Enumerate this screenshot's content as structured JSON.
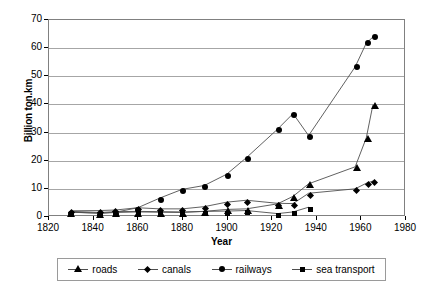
{
  "chart_data": {
    "type": "line",
    "title": "",
    "xlabel": "Year",
    "ylabel": "Billion ton.km",
    "xlim": [
      1820,
      1980
    ],
    "ylim": [
      0,
      70
    ],
    "xticks": [
      1820,
      1840,
      1860,
      1880,
      1900,
      1920,
      1940,
      1960,
      1980
    ],
    "yticks": [
      0,
      10,
      20,
      30,
      40,
      50,
      60,
      70
    ],
    "grid": "horizontal",
    "legend_position": "bottom",
    "series": [
      {
        "name": "roads",
        "marker": "triangle",
        "points": [
          {
            "x": 1830,
            "y": 1.0
          },
          {
            "x": 1843,
            "y": 0.6
          },
          {
            "x": 1850,
            "y": 0.9
          },
          {
            "x": 1860,
            "y": 1.1
          },
          {
            "x": 1870,
            "y": 1.0
          },
          {
            "x": 1880,
            "y": 0.9
          },
          {
            "x": 1890,
            "y": 1.3
          },
          {
            "x": 1900,
            "y": 2.0
          },
          {
            "x": 1909,
            "y": 2.2
          },
          {
            "x": 1923,
            "y": 4.0
          },
          {
            "x": 1930,
            "y": 6.7
          },
          {
            "x": 1937,
            "y": 11.2
          },
          {
            "x": 1958,
            "y": 17.3
          },
          {
            "x": 1963,
            "y": 27.7
          },
          {
            "x": 1966,
            "y": 39.6
          }
        ]
      },
      {
        "name": "canals",
        "marker": "diamond",
        "points": [
          {
            "x": 1830,
            "y": 1.5
          },
          {
            "x": 1843,
            "y": 1.6
          },
          {
            "x": 1850,
            "y": 1.8
          },
          {
            "x": 1860,
            "y": 2.6
          },
          {
            "x": 1870,
            "y": 2.2
          },
          {
            "x": 1880,
            "y": 2.2
          },
          {
            "x": 1890,
            "y": 3.0
          },
          {
            "x": 1900,
            "y": 4.6
          },
          {
            "x": 1909,
            "y": 5.3
          },
          {
            "x": 1923,
            "y": 4.2
          },
          {
            "x": 1930,
            "y": 4.1
          },
          {
            "x": 1937,
            "y": 7.8
          },
          {
            "x": 1958,
            "y": 9.4
          },
          {
            "x": 1963,
            "y": 11.4
          },
          {
            "x": 1966,
            "y": 12.2
          }
        ]
      },
      {
        "name": "railways",
        "marker": "circle",
        "points": [
          {
            "x": 1830,
            "y": 1.0
          },
          {
            "x": 1843,
            "y": 0.7
          },
          {
            "x": 1850,
            "y": 1.0
          },
          {
            "x": 1860,
            "y": 2.6
          },
          {
            "x": 1870,
            "y": 6.1
          },
          {
            "x": 1880,
            "y": 9.2
          },
          {
            "x": 1890,
            "y": 10.6
          },
          {
            "x": 1900,
            "y": 14.6
          },
          {
            "x": 1909,
            "y": 20.6
          },
          {
            "x": 1923,
            "y": 30.8
          },
          {
            "x": 1930,
            "y": 36.4
          },
          {
            "x": 1937,
            "y": 28.5
          },
          {
            "x": 1958,
            "y": 53.2
          },
          {
            "x": 1963,
            "y": 61.7
          },
          {
            "x": 1966,
            "y": 63.9
          }
        ]
      },
      {
        "name": "sea transport",
        "marker": "square",
        "points": [
          {
            "x": 1830,
            "y": 1.3
          },
          {
            "x": 1843,
            "y": 0.9
          },
          {
            "x": 1850,
            "y": 1.2
          },
          {
            "x": 1860,
            "y": 1.3
          },
          {
            "x": 1870,
            "y": 1.2
          },
          {
            "x": 1880,
            "y": 1.1
          },
          {
            "x": 1890,
            "y": 1.3
          },
          {
            "x": 1900,
            "y": 1.4
          },
          {
            "x": 1909,
            "y": 1.6
          },
          {
            "x": 1923,
            "y": 0.5
          },
          {
            "x": 1930,
            "y": 1.1
          },
          {
            "x": 1937,
            "y": 2.8
          }
        ]
      }
    ]
  },
  "legend": {
    "items": [
      {
        "label": "roads",
        "marker": "triangle"
      },
      {
        "label": "canals",
        "marker": "diamond"
      },
      {
        "label": "railways",
        "marker": "circle"
      },
      {
        "label": "sea transport",
        "marker": "square"
      }
    ]
  },
  "colors": {
    "line": "#4d4d4d",
    "marker": "#000000",
    "grid": "#a6a6a6",
    "frame": "#808080",
    "background": "#ffffff"
  }
}
